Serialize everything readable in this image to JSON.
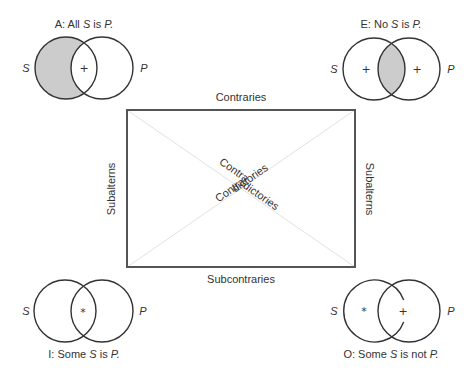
{
  "diagram": {
    "colors": {
      "stroke": "#333333",
      "shade": "#cccccc",
      "diagonal": "#e2e2e2",
      "box": "#555555"
    },
    "square": {
      "top_label": "Contraries",
      "bottom_label": "Subcontraries",
      "left_label": "Subalterns",
      "right_label": "Subalterns",
      "diagonal_labels": [
        {
          "part1": "Contra",
          "part2": "dictories"
        },
        {
          "part1": "Contra",
          "part2": "dictories"
        }
      ]
    },
    "propositions": {
      "A": {
        "letter": "A:",
        "pre": "All",
        "s": "S",
        "mid": "is",
        "p": "P.",
        "mark": "+",
        "shaded": "S-only",
        "circle_labels": [
          "S",
          "P"
        ]
      },
      "E": {
        "letter": "E:",
        "pre": "No",
        "s": "S",
        "mid": "is",
        "p": "P.",
        "marks": [
          "+",
          "+"
        ],
        "shaded": "intersection",
        "circle_labels": [
          "S",
          "P"
        ]
      },
      "I": {
        "letter": "I:",
        "pre": "Some",
        "s": "S",
        "mid": "is",
        "p": "P.",
        "mark": "*",
        "shaded": "none",
        "circle_labels": [
          "S",
          "P"
        ]
      },
      "O": {
        "letter": "O:",
        "pre": "Some",
        "s": "S",
        "mid": "is not",
        "p": "P.",
        "marks": [
          "*",
          "+"
        ],
        "shaded": "none",
        "circle_labels": [
          "S",
          "P"
        ]
      }
    }
  }
}
